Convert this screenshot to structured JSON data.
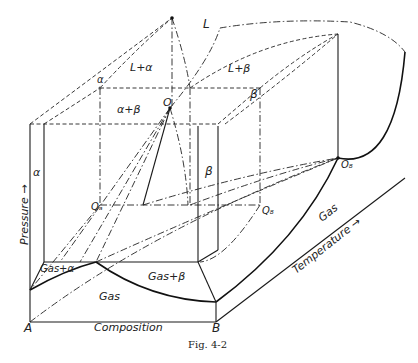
{
  "figure": {
    "caption": "Fig. 4-2",
    "axes": {
      "vertical": "Pressure →",
      "horizontal": "Composition",
      "depth": "Temperature →"
    },
    "corner_labels": {
      "A": "A",
      "B": "B"
    },
    "region_labels": {
      "L": "L",
      "L_alpha": "L+α",
      "L_beta": "L+β",
      "alpha_beta": "α+β",
      "alpha_top": "α",
      "beta_top": "β",
      "alpha_side": "α",
      "beta_mid": "β",
      "gas_alpha": "Gas+α",
      "gas_beta": "Gas+β",
      "gas_front": "Gas",
      "gas_side": "Gas"
    },
    "point_labels": {
      "O": "O",
      "OA": "Oₐ",
      "OB": "O₈",
      "QA": "Qₐ",
      "QB": "Q₈"
    }
  }
}
